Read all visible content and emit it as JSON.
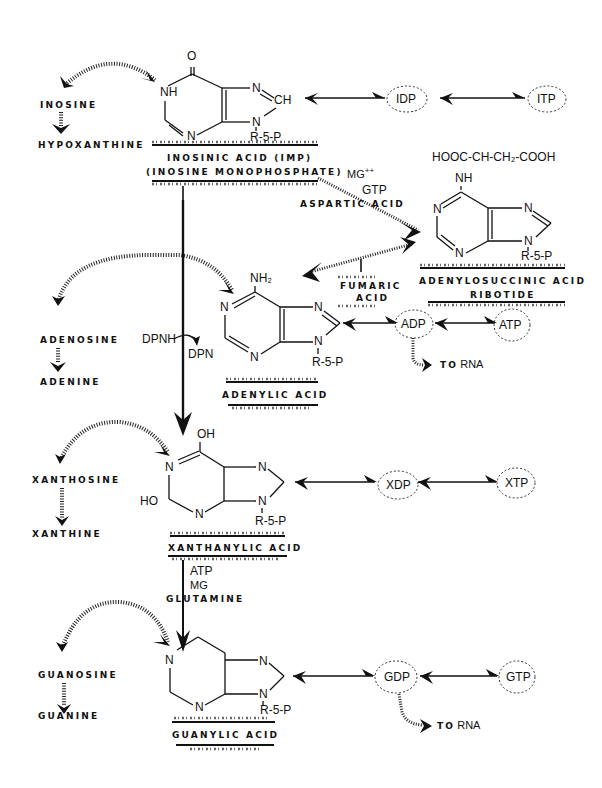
{
  "diagram": {
    "type": "biochemical-pathway",
    "compounds": {
      "imp": {
        "name": "INOSINIC ACID (IMP)",
        "alt_name": "(INOSINE MONOPHOSPHATE)",
        "atoms": {
          "o": "O",
          "nh": "NH",
          "n1": "N",
          "n2": "N",
          "ch": "CH",
          "n3": "N",
          "r": "R-5-P"
        }
      },
      "adenylosuccinic": {
        "name": "ADENYLOSUCCINIC ACID",
        "name2": "RIBOTIDE",
        "side_chain": "HOOC-CH-CH₂-COOH",
        "atoms": {
          "nh": "NH",
          "n1": "N",
          "n2": "N",
          "n3": "N",
          "n4": "N",
          "r": "R-5-P"
        }
      },
      "amp": {
        "name": "ADENYLIC ACID",
        "atoms": {
          "nh2": "NH₂",
          "n1": "N",
          "n2": "N",
          "n3": "N",
          "n4": "N",
          "r": "R-5-P"
        }
      },
      "xmp": {
        "name": "XANTHANYLIC ACID",
        "atoms": {
          "oh": "OH",
          "n1": "N",
          "ho": "HO",
          "n2": "N",
          "n3": "N",
          "n4": "N",
          "r": "R-5-P"
        }
      },
      "gmp": {
        "name": "GUANYLIC ACID",
        "atoms": {
          "n1": "N",
          "n2": "N",
          "n3": "N",
          "n4": "N",
          "r": "R-5-P"
        }
      }
    },
    "side_products": {
      "inosine": "INOSINE",
      "hypoxanthine": "HYPOXANTHINE",
      "adenosine": "ADENOSINE",
      "adenine": "ADENINE",
      "xanthosine": "XANTHOSINE",
      "xanthine": "XANTHINE",
      "guanosine": "GUANOSINE",
      "guanine": "GUANINE"
    },
    "nucleotides": {
      "idp": "IDP",
      "itp": "ITP",
      "adp": "ADP",
      "atp": "ATP",
      "xdp": "XDP",
      "xtp": "XTP",
      "gdp": "GDP",
      "gtp": "GTP"
    },
    "cofactors": {
      "mg_plus": "MG",
      "mg_sup": "++",
      "gtp": "GTP",
      "aspartic_acid": "ASPARTIC ACID",
      "fumaric": "FUMARIC",
      "acid": "ACID",
      "dpnh": "DPNH",
      "dpn": "DPN",
      "atp": "ATP",
      "mg": "MG",
      "glutamine": "GLUTAMINE"
    },
    "to_rna_adp": "TO RNA",
    "to_rna_gdp": "TO RNA",
    "to": "TO",
    "rna": "RNA"
  }
}
